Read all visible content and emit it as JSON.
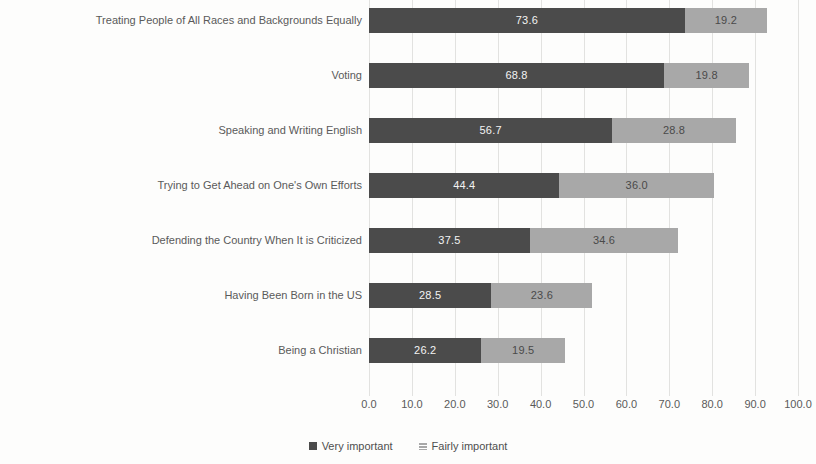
{
  "chart_data": {
    "type": "bar",
    "orientation": "horizontal",
    "stacked": true,
    "title": "",
    "subtitle": "",
    "xlabel": "",
    "ylabel": "",
    "xlim": [
      0,
      100
    ],
    "xticks": [
      "0.0",
      "10.0",
      "20.0",
      "30.0",
      "40.0",
      "50.0",
      "60.0",
      "70.0",
      "80.0",
      "90.0",
      "100.0"
    ],
    "xtick_values": [
      0,
      10,
      20,
      30,
      40,
      50,
      60,
      70,
      80,
      90,
      100
    ],
    "grid": true,
    "grid_axis": "x",
    "legend_position": "bottom",
    "categories": [
      "Treating People of All Races and Backgrounds Equally",
      "Voting",
      "Speaking and Writing English",
      "Trying to Get Ahead on One's Own Efforts",
      "Defending the Country When It is Criticized",
      "Having Been Born in the US",
      "Being a Christian"
    ],
    "series": [
      {
        "name": "Very important",
        "color": "#4b4b4b",
        "values": [
          73.6,
          68.8,
          56.7,
          44.4,
          37.5,
          28.5,
          26.2
        ],
        "labels": [
          "73.6",
          "68.8",
          "56.7",
          "44.4",
          "37.5",
          "28.5",
          "26.2"
        ]
      },
      {
        "name": "Fairly important",
        "color": "#a8a8a8",
        "values": [
          19.2,
          19.8,
          28.8,
          36.0,
          34.6,
          23.6,
          19.5
        ],
        "labels": [
          "19.2",
          "19.8",
          "28.8",
          "36.0",
          "34.6",
          "23.6",
          "19.5"
        ]
      }
    ]
  },
  "legend": {
    "items": [
      {
        "label": "Very important",
        "swatch": "very"
      },
      {
        "label": "Fairly important",
        "swatch": "fairly"
      }
    ]
  },
  "colors": {
    "very_important": "#4b4b4b",
    "fairly_important": "#a8a8a8",
    "gridline": "#e2e2e0",
    "text": "#5a5a5a",
    "background": "#fdfdfc"
  }
}
